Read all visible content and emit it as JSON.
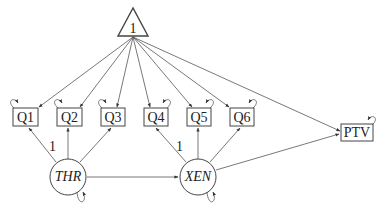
{
  "diagram": {
    "type": "SEM path diagram",
    "constant": {
      "label": "1",
      "shape": "triangle"
    },
    "observed": [
      {
        "id": "Q1",
        "label": "Q1"
      },
      {
        "id": "Q2",
        "label": "Q2"
      },
      {
        "id": "Q3",
        "label": "Q3"
      },
      {
        "id": "Q4",
        "label": "Q4"
      },
      {
        "id": "Q5",
        "label": "Q5"
      },
      {
        "id": "Q6",
        "label": "Q6"
      },
      {
        "id": "PTV",
        "label": "PTV"
      }
    ],
    "latent": [
      {
        "id": "THR",
        "label": "THR"
      },
      {
        "id": "XEN",
        "label": "XEN"
      }
    ],
    "loadings": [
      {
        "from": "THR",
        "to": "Q1",
        "label": "1"
      },
      {
        "from": "THR",
        "to": "Q2",
        "label": ""
      },
      {
        "from": "THR",
        "to": "Q3",
        "label": ""
      },
      {
        "from": "XEN",
        "to": "Q4",
        "label": "1"
      },
      {
        "from": "XEN",
        "to": "Q5",
        "label": ""
      },
      {
        "from": "XEN",
        "to": "Q6",
        "label": ""
      }
    ],
    "paths": [
      {
        "from": "THR",
        "to": "XEN"
      },
      {
        "from": "XEN",
        "to": "PTV"
      }
    ],
    "intercepts_from_constant": [
      "Q1",
      "Q2",
      "Q3",
      "Q4",
      "Q5",
      "Q6",
      "PTV"
    ],
    "fixed_loading_label": "1"
  }
}
